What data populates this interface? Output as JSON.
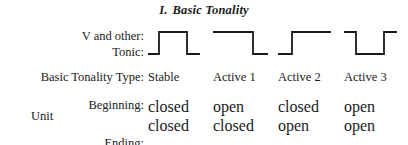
{
  "figure": {
    "title_numeral": "I.",
    "title_text": "Basic Tonality",
    "line_color": "#1a1a1a",
    "background_color": "#ffffff"
  },
  "wave_row": {
    "label_line1": "V and other:",
    "label_line2": "Tonic:"
  },
  "type_row": {
    "label": "Basic Tonality Type:"
  },
  "unit_block": {
    "label": "Unit",
    "beginning_label": "Beginning:",
    "ending_label": "Ending:"
  },
  "columns": [
    {
      "type": "Stable",
      "beginning": "closed",
      "ending": "closed",
      "wave_name": "pulse-up-stable",
      "wave_points": "0,26 11,26 11,4 39,4 39,26 51,26"
    },
    {
      "type": "Active 1",
      "beginning": "open",
      "ending": "closed",
      "wave_name": "falling-step-active-1",
      "wave_points": "0,4 40,4 40,26 54,26"
    },
    {
      "type": "Active 2",
      "beginning": "closed",
      "ending": "open",
      "wave_name": "rising-step-active-2",
      "wave_points": "0,26 14,26 14,4 52,4"
    },
    {
      "type": "Active 3",
      "beginning": "open",
      "ending": "open",
      "wave_name": "dip-down-active-3",
      "wave_points": "0,4 12,4 12,26 40,26 40,4 52,4"
    }
  ],
  "layout": {
    "column_x": [
      148,
      213,
      278,
      344
    ],
    "wave_x": [
      148,
      213,
      278,
      344
    ]
  }
}
